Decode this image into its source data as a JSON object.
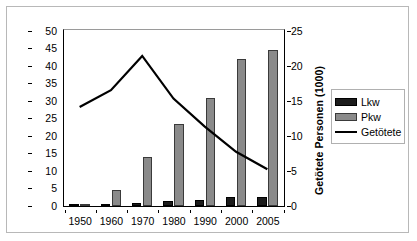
{
  "chart_data": {
    "type": "bar",
    "title": "",
    "subtitle": "",
    "xlabel": "",
    "ylabel": "Fahrzeuge (Mio.)",
    "y2label": "Getötete Personen (1000)",
    "categories": [
      "1950",
      "1960",
      "1970",
      "1980",
      "1990",
      "2000",
      "2005"
    ],
    "ylim": [
      0,
      50
    ],
    "yticks": [
      0,
      5,
      10,
      15,
      20,
      25,
      30,
      35,
      40,
      45,
      50
    ],
    "y2lim": [
      0,
      25
    ],
    "y2ticks": [
      0,
      5,
      10,
      15,
      20,
      25
    ],
    "grid": false,
    "legend_position": "right",
    "series": [
      {
        "name": "Lkw",
        "kind": "bar",
        "axis": "left",
        "unit": "Mio.",
        "color": "#1c1c1c",
        "values": [
          0.3,
          0.7,
          1.0,
          1.3,
          1.6,
          2.5,
          2.6
        ]
      },
      {
        "name": "Pkw",
        "kind": "bar",
        "axis": "left",
        "unit": "Mio.",
        "color": "#8a8a8a",
        "values": [
          0.5,
          4.5,
          14.0,
          23.5,
          31.0,
          42.0,
          44.5
        ]
      },
      {
        "name": "Getötete",
        "kind": "line",
        "axis": "right",
        "unit": "1000",
        "color": "#000000",
        "values": [
          14.0,
          16.4,
          21.3,
          15.2,
          11.2,
          7.6,
          5.1
        ]
      }
    ]
  },
  "legend": {
    "items": [
      {
        "label": "Lkw",
        "swatch": "bar-dark"
      },
      {
        "label": "Pkw",
        "swatch": "bar-gray"
      },
      {
        "label": "Getötete",
        "swatch": "line-black"
      }
    ]
  }
}
